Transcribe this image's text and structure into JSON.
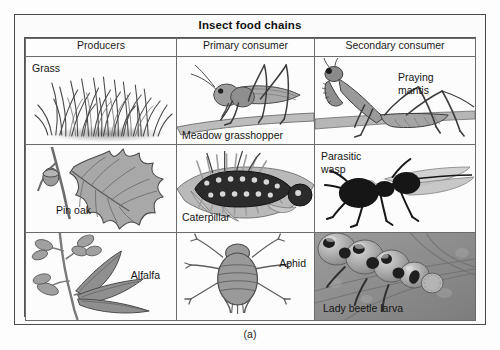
{
  "figure": {
    "title": "Insect food chains",
    "caption": "(a)",
    "columns": [
      "Producers",
      "Primary consumer",
      "Secondary consumer"
    ],
    "rows": [
      {
        "producer": {
          "label": "Grass",
          "art": "grass-illustration"
        },
        "primary_consumer": {
          "label": "Meadow grasshopper",
          "art": "grasshopper-illustration"
        },
        "secondary_consumer": {
          "label": "Praying\nmantis",
          "art": "praying-mantis-illustration"
        }
      },
      {
        "producer": {
          "label": "Pin oak",
          "art": "pin-oak-leaf-illustration"
        },
        "primary_consumer": {
          "label": "Caterpillar",
          "art": "caterpillar-illustration"
        },
        "secondary_consumer": {
          "label": "Parasitic\nwasp",
          "art": "parasitic-wasp-illustration"
        }
      },
      {
        "producer": {
          "label": "Alfalfa",
          "art": "alfalfa-plant-illustration"
        },
        "primary_consumer": {
          "label": "Aphid",
          "art": "aphid-illustration"
        },
        "secondary_consumer": {
          "label": "Lady beetle larva",
          "art": "lady-beetle-larva-photo"
        }
      }
    ]
  },
  "colors": {
    "frame_border": "#4a4a4a",
    "grid_border": "#6b6b6b",
    "page_background": "#fdfdfd",
    "cell_background": "#fcfcfc",
    "photo_background": "#8f8f8f",
    "art_gray_dark": "#3c3c3c",
    "art_gray_mid": "#8a8a8a",
    "art_gray_light": "#c4c4c4"
  }
}
